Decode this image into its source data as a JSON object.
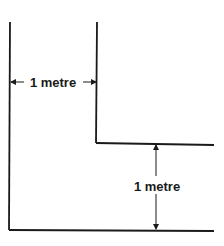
{
  "diagram": {
    "type": "step-dimension",
    "colors": {
      "line": "#1a1a1a",
      "background": "#ffffff"
    },
    "labels": {
      "horizontal_dimension": "1 metre",
      "vertical_dimension": "1 metre"
    }
  }
}
